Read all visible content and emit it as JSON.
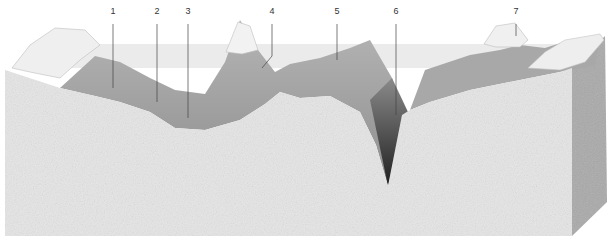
{
  "diagram": {
    "type": "seafloor-block-diagram",
    "labels": [
      {
        "id": "1",
        "text": "1",
        "x": 113,
        "y": 14,
        "line_to_y": 88
      },
      {
        "id": "2",
        "text": "2",
        "x": 157,
        "y": 14,
        "line_to_y": 102
      },
      {
        "id": "3",
        "text": "3",
        "x": 188,
        "y": 14,
        "line_to_y": 118
      },
      {
        "id": "4",
        "text": "4",
        "x": 272,
        "y": 14,
        "line_to_y": 68
      },
      {
        "id": "5",
        "text": "5",
        "x": 337,
        "y": 14,
        "line_to_y": 60
      },
      {
        "id": "6",
        "text": "6",
        "x": 396,
        "y": 14,
        "line_to_y": 115
      },
      {
        "id": "7",
        "text": "7",
        "x": 516,
        "y": 14,
        "line_to_y": 36
      }
    ],
    "colors": {
      "block_front": "#e4e4e4",
      "block_side": "#a9a9a9",
      "sea_surface": "#d4d4d4",
      "seafloor": "#9a9a9a",
      "land": "#eeeeee",
      "trench": "#3a3a3a"
    }
  }
}
